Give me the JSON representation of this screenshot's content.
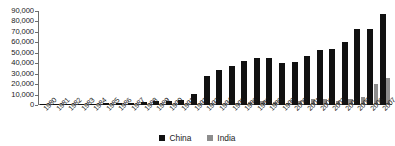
{
  "chart_data": {
    "type": "bar",
    "title": "",
    "subtitle": "",
    "xlabel": "",
    "ylabel": "",
    "ylim": [
      0,
      90000
    ],
    "ytick_labels": [
      "90,000",
      "80,000",
      "70,000",
      "60,000",
      "50,000",
      "40,000",
      "30,000",
      "20,000",
      "10,000",
      "0"
    ],
    "ytick_values": [
      90000,
      80000,
      70000,
      60000,
      50000,
      40000,
      30000,
      20000,
      10000,
      0
    ],
    "grid": false,
    "legend_position": "bottom-center",
    "categories": [
      "1980",
      "1981",
      "1982",
      "1983",
      "1984",
      "1985",
      "1986",
      "1987",
      "1988",
      "1989",
      "1990",
      "1991",
      "1992",
      "1993",
      "1994",
      "1995",
      "1996",
      "1997",
      "1998",
      "1999",
      "2000",
      "2001",
      "2002",
      "2003",
      "2004",
      "2005",
      "2006",
      "2007"
    ],
    "series": [
      {
        "name": "China",
        "color": "#111111",
        "values": [
          60,
          260,
          440,
          920,
          1420,
          1960,
          2240,
          2310,
          3190,
          3390,
          3490,
          4370,
          11010,
          27520,
          33770,
          37520,
          41730,
          45260,
          45460,
          40320,
          40710,
          46880,
          52740,
          53500,
          60630,
          72410,
          72710,
          87000
        ]
      },
      {
        "name": "India",
        "color": "#8d8d8d",
        "values": [
          80,
          90,
          70,
          10,
          20,
          110,
          120,
          210,
          90,
          250,
          240,
          70,
          280,
          550,
          970,
          2140,
          2430,
          3580,
          2630,
          2170,
          3580,
          5480,
          5630,
          4320,
          5770,
          7610,
          19660,
          25480
        ]
      }
    ]
  },
  "legend": {
    "entries": [
      {
        "label": "China"
      },
      {
        "label": "India"
      }
    ]
  }
}
